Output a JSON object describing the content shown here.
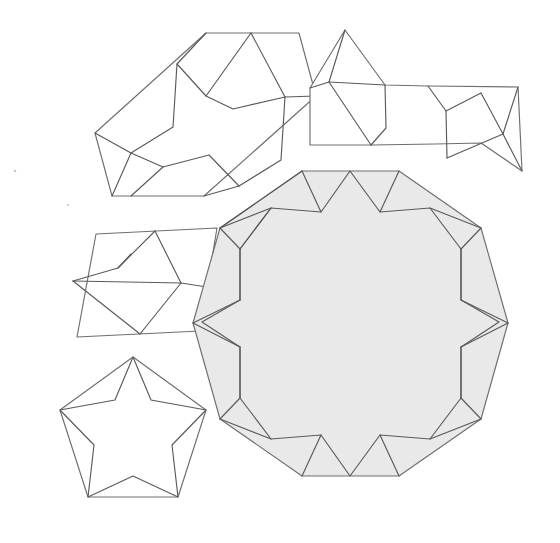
{
  "figure": {
    "title": "Girih tile set",
    "canvas": {
      "width": 560,
      "height": 543
    },
    "colors": {
      "background": "#ffffff",
      "tile_fill_shaded": "#e9e9e9",
      "tile_fill_white": "#ffffff",
      "outline_stroke": "#6e6e6e",
      "strap_stroke": "#5a5a5a"
    },
    "stroke_width": 1.15
  },
  "tiles": [
    {
      "id": "hexagon",
      "name": "elongated-hexagon-tile",
      "label": "Elongated hexagon",
      "interior_angles_deg": [
        72,
        144,
        144,
        72,
        144,
        144
      ],
      "fill": "#ffffff",
      "outline": "209,33 302,33 247,106 265,43",
      "outline_points": "209,33 302,33 314,96 202,196 109,196 97,133",
      "straps": [
        "M 153,64.5 L 205,148 L 257,148 L 205,64.5 Z",
        "M 209,33 L 257,148",
        "M 258,164.5 L 206,81 L 154,81 L 206,164.5 Z"
      ]
    },
    {
      "id": "bowtie",
      "name": "bowtie-tile",
      "label": "Bowtie (bobbin)",
      "interior_angles_deg": [
        72,
        72,
        216,
        72,
        72,
        216
      ],
      "fill": "#ffffff"
    },
    {
      "id": "rhombus",
      "name": "rhombus-tile",
      "label": "Rhombus",
      "interior_angles_deg": [
        72,
        108,
        72,
        108
      ],
      "fill": "#ffffff"
    },
    {
      "id": "pentagon",
      "name": "pentagon-tile",
      "label": "Regular pentagon",
      "interior_angles_deg": [
        108,
        108,
        108,
        108,
        108
      ],
      "fill": "#ffffff"
    },
    {
      "id": "decagon",
      "name": "decagon-tile",
      "label": "Regular decagon",
      "interior_angles_deg": [
        144,
        144,
        144,
        144,
        144,
        144,
        144,
        144,
        144,
        144
      ],
      "fill": "#e9e9e9",
      "center": [
        350.5,
        323.5
      ],
      "circumradius": 157,
      "star_points": 10
    }
  ],
  "geometry": {
    "decagon": {
      "cx": 350.5,
      "cy": 323.5,
      "R": 157,
      "rotation_deg": 18,
      "inner_star_ratio": 0.618
    },
    "pentagon": {
      "cx": 133,
      "cy": 434,
      "R": 77,
      "rotation_deg": -90,
      "inner_star_ratio": 0.618
    },
    "rhombus": {
      "cx": 148,
      "cy": 281,
      "half_long": 78,
      "half_short": 56,
      "tilt_deg": 12
    },
    "hexagon": {
      "cx": 205,
      "cy": 114,
      "long_half": 112,
      "short_half": 52,
      "tilt_deg": -31
    },
    "bowtie": {
      "cx": 420,
      "cy": 97,
      "tilt_deg": 0
    }
  },
  "specks": [
    {
      "x": 15,
      "y": 171,
      "r": 1.3
    },
    {
      "x": 68,
      "y": 205,
      "r": 1.1
    }
  ]
}
